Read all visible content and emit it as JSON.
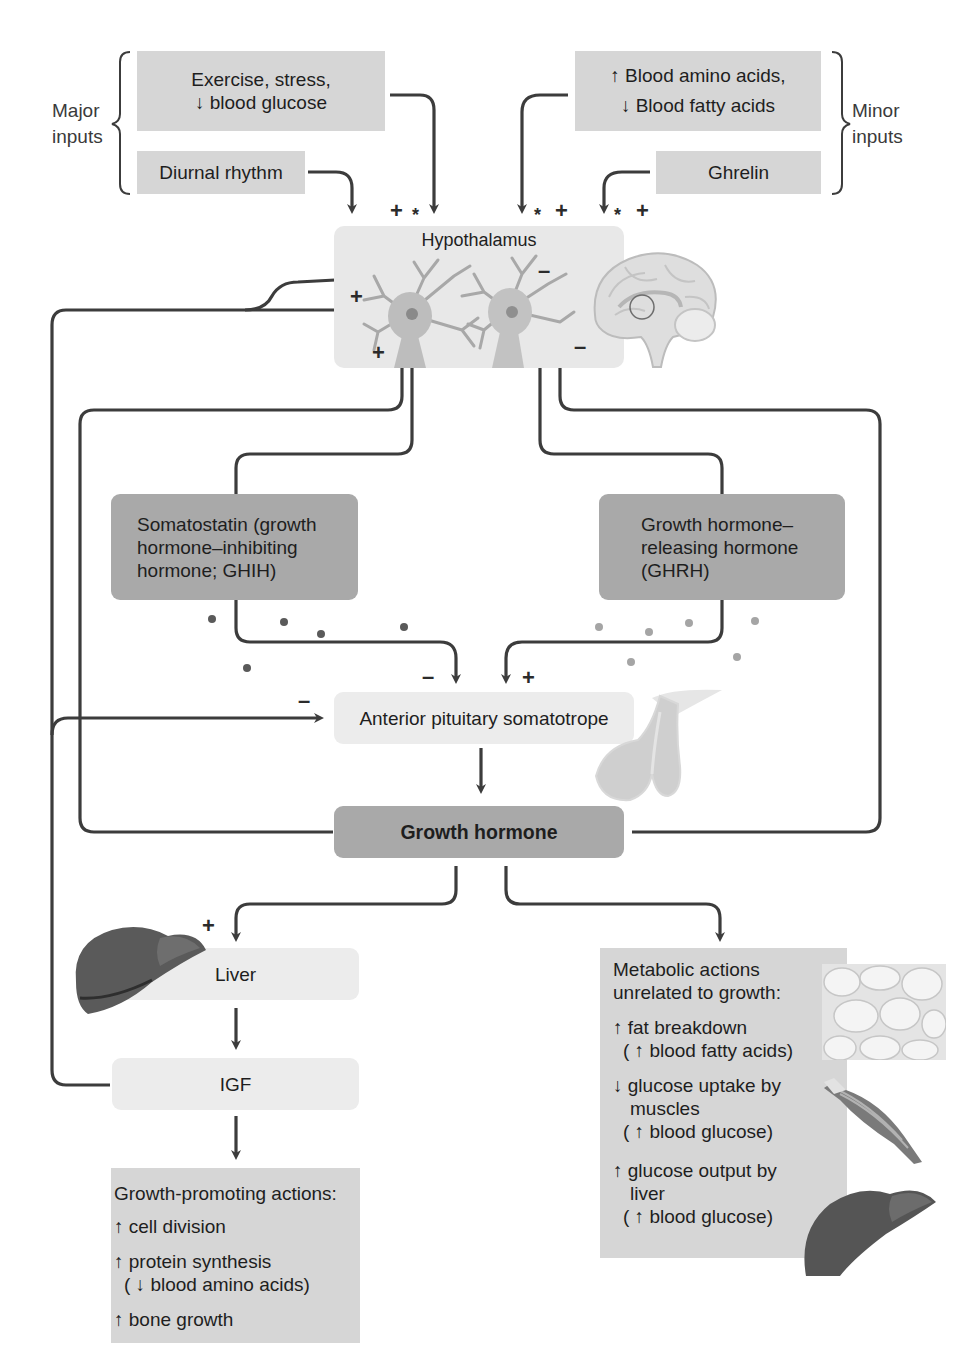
{
  "diagram": {
    "title_hint": "Growth hormone regulation and actions",
    "major_inputs": {
      "label": "Major\ninputs",
      "label_line1": "Major",
      "label_line2": "inputs",
      "items": [
        {
          "line1": "Exercise, stress,",
          "line2": "↓ blood glucose"
        },
        {
          "line1": "Diurnal rhythm"
        }
      ]
    },
    "minor_inputs": {
      "label_line1": "Minor",
      "label_line2": "inputs",
      "items": [
        {
          "line1": "↑ Blood amino acids,",
          "line2": "↓ Blood fatty acids"
        },
        {
          "line1": "Ghrelin"
        }
      ]
    },
    "hypothalamus": {
      "label": "Hypothalamus"
    },
    "signs": {
      "plus": "+",
      "minus": "–",
      "star": "*"
    },
    "somatostatin": {
      "line1": "Somatostatin (growth",
      "line2": "hormone–inhibiting",
      "line3": "hormone; GHIH)"
    },
    "ghrh": {
      "line1": "Growth hormone–",
      "line2": "releasing hormone",
      "line3": "(GHRH)"
    },
    "somatotrope": {
      "label": "Anterior pituitary somatotrope"
    },
    "growth_hormone": {
      "label": "Growth hormone"
    },
    "liver": {
      "label": "Liver"
    },
    "igf": {
      "label": "IGF"
    },
    "growth_actions": {
      "title": "Growth-promoting actions:",
      "items": [
        {
          "text": "↑ cell division"
        },
        {
          "text": "↑ protein synthesis",
          "sub": "( ↓ blood amino acids)"
        },
        {
          "text": "↑ bone growth"
        }
      ]
    },
    "metabolic_actions": {
      "title_line1": "Metabolic actions",
      "title_line2": "unrelated to growth:",
      "items": [
        {
          "text": "↑ fat breakdown",
          "sub": "( ↑ blood fatty acids)"
        },
        {
          "text": "↓ glucose uptake by",
          "text2": "muscles",
          "sub": "( ↑ blood glucose)"
        },
        {
          "text": "↑ glucose output by",
          "text2": "liver",
          "sub": "( ↑ blood glucose)"
        }
      ]
    },
    "colors": {
      "input_box": "#d6d6d6",
      "light_box": "#ececec",
      "hormone_box": "#a9a9a9",
      "wire": "#3c3c3c",
      "ghih_dot": "#5a5a5a",
      "ghrh_dot": "#a0a0a0"
    }
  }
}
